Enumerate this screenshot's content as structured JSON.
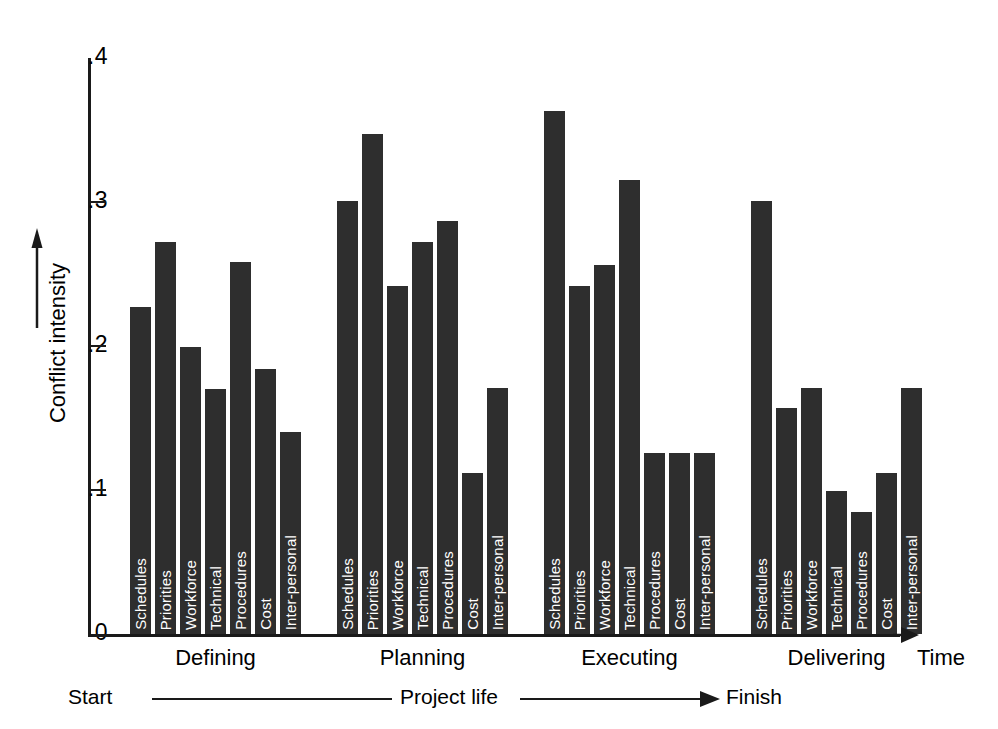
{
  "chart_data": {
    "type": "bar",
    "title": "",
    "xlabel": "Time",
    "ylabel": "Conflict intensity",
    "ylim": [
      0,
      0.4
    ],
    "grid": false,
    "legend": "none",
    "y_ticks": [
      {
        "value": 0.4,
        "label": ".4"
      },
      {
        "value": 0.3,
        "label": ".3"
      },
      {
        "value": 0.2,
        "label": ".2"
      },
      {
        "value": 0.1,
        "label": ".1"
      },
      {
        "value": 0.0,
        "label": "0"
      }
    ],
    "categories": [
      "Schedules",
      "Priorities",
      "Workforce",
      "Technical",
      "Procedures",
      "Cost",
      "Inter-personal"
    ],
    "groups": [
      {
        "name": "Defining",
        "values": [
          0.227,
          0.272,
          0.199,
          0.17,
          0.258,
          0.184,
          0.14
        ]
      },
      {
        "name": "Planning",
        "values": [
          0.301,
          0.347,
          0.242,
          0.272,
          0.287,
          0.112,
          0.171
        ]
      },
      {
        "name": "Executing",
        "values": [
          0.363,
          0.242,
          0.256,
          0.315,
          0.126,
          0.126,
          0.126
        ]
      },
      {
        "name": "Delivering",
        "values": [
          0.301,
          0.157,
          0.171,
          0.099,
          0.085,
          0.112,
          0.171
        ]
      }
    ],
    "bar_color": "#2e2e2e",
    "axis_color": "#1a1a1a",
    "bar_label_color": "#ffffff"
  },
  "axes": {
    "y_arrow": "up-arrow-icon",
    "x_arrow": "right-arrow-icon",
    "x_axis_caption": "Time"
  },
  "footer": {
    "start_label": "Start",
    "middle_label": "Project life",
    "finish_label": "Finish",
    "arrow": "right-arrow-icon"
  }
}
